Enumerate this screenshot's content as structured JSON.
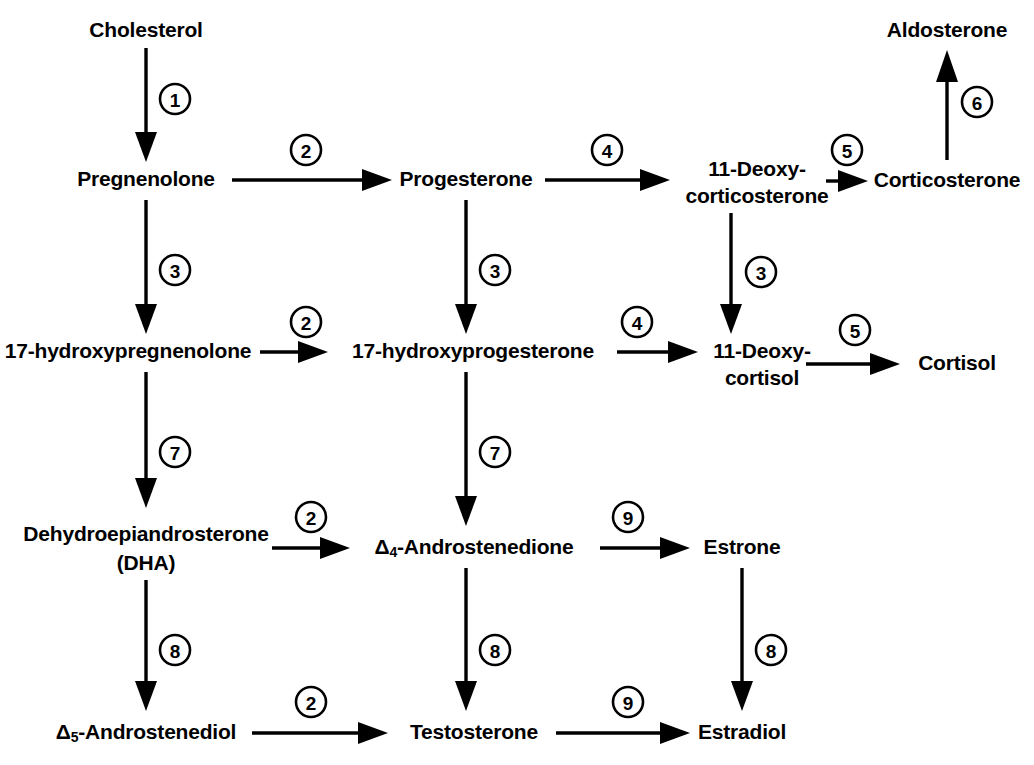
{
  "diagram": {
    "background_color": "#ffffff",
    "line_color": "#000000",
    "width": 1034,
    "height": 765,
    "nodes": [
      {
        "id": "cholesterol",
        "label": "Cholesterol",
        "x": 146,
        "y": 22,
        "lines": [
          "Cholesterol"
        ]
      },
      {
        "id": "pregnenolone",
        "label": "Pregnenolone",
        "x": 146,
        "y": 180,
        "lines": [
          "Pregnenolone"
        ]
      },
      {
        "id": "progesterone",
        "label": "Progesterone",
        "x": 466,
        "y": 180,
        "lines": [
          "Progesterone"
        ]
      },
      {
        "id": "deoxycorticosterone",
        "label": "11-Deoxycorticosterone",
        "x": 757,
        "y": 169,
        "lines": [
          "11-Deoxy-",
          "corticosterone"
        ]
      },
      {
        "id": "corticosterone",
        "label": "Corticosterone",
        "x": 947,
        "y": 180,
        "lines": [
          "Corticosterone"
        ]
      },
      {
        "id": "aldosterone",
        "label": "Aldosterone",
        "x": 947,
        "y": 22,
        "lines": [
          "Aldosterone"
        ]
      },
      {
        "id": "17-hydroxypregnenolone",
        "label": "17-hydroxypregnenolone",
        "x": 128,
        "y": 352,
        "lines": [
          "17-hydroxypregnenolone"
        ]
      },
      {
        "id": "17-hydroxyprogesterone",
        "label": "17-hydroxyprogesterone",
        "x": 473,
        "y": 352,
        "lines": [
          "17-hydroxyprogesterone"
        ]
      },
      {
        "id": "deoxycortisol",
        "label": "11-Deoxycortisol",
        "x": 762,
        "y": 341,
        "lines": [
          "11-Deoxy-",
          "cortisol"
        ]
      },
      {
        "id": "cortisol",
        "label": "Cortisol",
        "x": 957,
        "y": 352,
        "lines": [
          "Cortisol"
        ]
      },
      {
        "id": "dha",
        "label": "Dehydroepiandrosterone (DHA)",
        "x": 146,
        "y": 527,
        "lines": [
          "Dehydroepiandrosterone",
          "(DHA)"
        ]
      },
      {
        "id": "androstenedione",
        "label": "Δ4-Androstenedione",
        "x": 474,
        "y": 545,
        "lines": [
          "Δ4-Androstenedione"
        ]
      },
      {
        "id": "estrone",
        "label": "Estrone",
        "x": 742,
        "y": 545,
        "lines": [
          "Estrone"
        ]
      },
      {
        "id": "androstenediol",
        "label": "Δ5-Androstenediol",
        "x": 146,
        "y": 731,
        "lines": [
          "Δ5-Androstenediol"
        ]
      },
      {
        "id": "testosterone",
        "label": "Testosterone",
        "x": 474,
        "y": 731,
        "lines": [
          "Testosterone"
        ]
      },
      {
        "id": "estradiol",
        "label": "Estradiol",
        "x": 742,
        "y": 731,
        "lines": [
          "Estradiol"
        ]
      }
    ],
    "edges": [
      {
        "id": "e1",
        "from": "cholesterol",
        "to": "pregnenolone",
        "enzyme": "1",
        "direction": "down"
      },
      {
        "id": "e2",
        "from": "pregnenolone",
        "to": "progesterone",
        "enzyme": "2",
        "direction": "right"
      },
      {
        "id": "e3",
        "from": "progesterone",
        "to": "deoxycorticosterone",
        "enzyme": "4",
        "direction": "right"
      },
      {
        "id": "e4",
        "from": "deoxycorticosterone",
        "to": "corticosterone",
        "enzyme": "5",
        "direction": "right"
      },
      {
        "id": "e5",
        "from": "corticosterone",
        "to": "aldosterone",
        "enzyme": "6",
        "direction": "up"
      },
      {
        "id": "e6",
        "from": "pregnenolone",
        "to": "17-hydroxypregnenolone",
        "enzyme": "3",
        "direction": "down"
      },
      {
        "id": "e7",
        "from": "progesterone",
        "to": "17-hydroxyprogesterone",
        "enzyme": "3",
        "direction": "down"
      },
      {
        "id": "e8",
        "from": "deoxycorticosterone",
        "to": "deoxycortisol",
        "enzyme": "3",
        "direction": "down"
      },
      {
        "id": "e9",
        "from": "17-hydroxypregnenolone",
        "to": "17-hydroxyprogesterone",
        "enzyme": "2",
        "direction": "right"
      },
      {
        "id": "e10",
        "from": "17-hydroxyprogesterone",
        "to": "deoxycortisol",
        "enzyme": "4",
        "direction": "right"
      },
      {
        "id": "e11",
        "from": "deoxycortisol",
        "to": "cortisol",
        "enzyme": "5",
        "direction": "right"
      },
      {
        "id": "e12",
        "from": "17-hydroxypregnenolone",
        "to": "dha",
        "enzyme": "7",
        "direction": "down"
      },
      {
        "id": "e13",
        "from": "17-hydroxyprogesterone",
        "to": "androstenedione",
        "enzyme": "7",
        "direction": "down"
      },
      {
        "id": "e14",
        "from": "dha",
        "to": "androstenedione",
        "enzyme": "2",
        "direction": "right"
      },
      {
        "id": "e15",
        "from": "androstenedione",
        "to": "estrone",
        "enzyme": "9",
        "direction": "right"
      },
      {
        "id": "e16",
        "from": "dha",
        "to": "androstenediol",
        "enzyme": "8",
        "direction": "down"
      },
      {
        "id": "e17",
        "from": "androstenedione",
        "to": "testosterone",
        "enzyme": "8",
        "direction": "down"
      },
      {
        "id": "e18",
        "from": "estrone",
        "to": "estradiol",
        "enzyme": "8",
        "direction": "down"
      },
      {
        "id": "e19",
        "from": "androstenediol",
        "to": "testosterone",
        "enzyme": "2",
        "direction": "right"
      },
      {
        "id": "e20",
        "from": "testosterone",
        "to": "estradiol",
        "enzyme": "9",
        "direction": "right"
      }
    ],
    "enzyme_numbers": [
      "1",
      "2",
      "3",
      "4",
      "5",
      "6",
      "7",
      "8",
      "9"
    ]
  }
}
